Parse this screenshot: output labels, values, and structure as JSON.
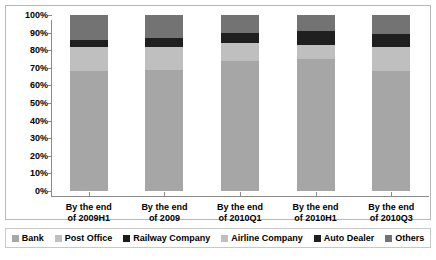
{
  "chart_data": {
    "type": "bar",
    "subtype": "stacked-100-percent",
    "title": "",
    "xlabel": "",
    "ylabel": "",
    "ylim": [
      0,
      100
    ],
    "ytick_labels": [
      "100%",
      "90%",
      "80%",
      "70%",
      "60%",
      "50%",
      "40%",
      "30%",
      "20%",
      "10%",
      "0%"
    ],
    "ytick_values": [
      100,
      90,
      80,
      70,
      60,
      50,
      40,
      30,
      20,
      10,
      0
    ],
    "grid": false,
    "legend_position": "bottom",
    "categories": [
      "By the end of 2009H1",
      "By the end of 2009",
      "By the end of 2010Q1",
      "By the end of 2010H1",
      "By the end of 2010Q3"
    ],
    "category_lines": [
      [
        "By the end",
        "of 2009H1"
      ],
      [
        "By the end",
        "of 2009"
      ],
      [
        "By the end",
        "of 2010Q1"
      ],
      [
        "By the end",
        "of 2010H1"
      ],
      [
        "By the end",
        "of 2010Q3"
      ]
    ],
    "series": [
      {
        "name": "Bank",
        "color": "#a6a6a6",
        "values": [
          68,
          69,
          74,
          75,
          68
        ]
      },
      {
        "name": "Post Office",
        "color": "#bfbfbf",
        "values": [
          0,
          0,
          0,
          0,
          0
        ]
      },
      {
        "name": "Railway Company",
        "color": "#1a1a1a",
        "values": [
          0,
          0,
          0,
          0,
          0
        ]
      },
      {
        "name": "Airline Company",
        "color": "#bfbfbf",
        "values": [
          14,
          13,
          10,
          8,
          14
        ]
      },
      {
        "name": "Auto Dealer",
        "color": "#1f1f1f",
        "values": [
          4,
          5,
          6,
          8,
          7
        ]
      },
      {
        "name": "Others",
        "color": "#737373",
        "values": [
          14,
          13,
          10,
          9,
          11
        ]
      }
    ]
  },
  "legend": {
    "items": [
      {
        "label": "Bank",
        "color": "#a6a6a6"
      },
      {
        "label": "Post Office",
        "color": "#bfbfbf"
      },
      {
        "label": "Railway Company",
        "color": "#1a1a1a"
      },
      {
        "label": "Airline Company",
        "color": "#bfbfbf"
      },
      {
        "label": "Auto Dealer",
        "color": "#1f1f1f"
      },
      {
        "label": "Others",
        "color": "#737373"
      }
    ]
  },
  "colors": {
    "axis": "#8a8a8a",
    "frame": "#b9b9b9",
    "text": "#000000",
    "background": "#ffffff"
  }
}
